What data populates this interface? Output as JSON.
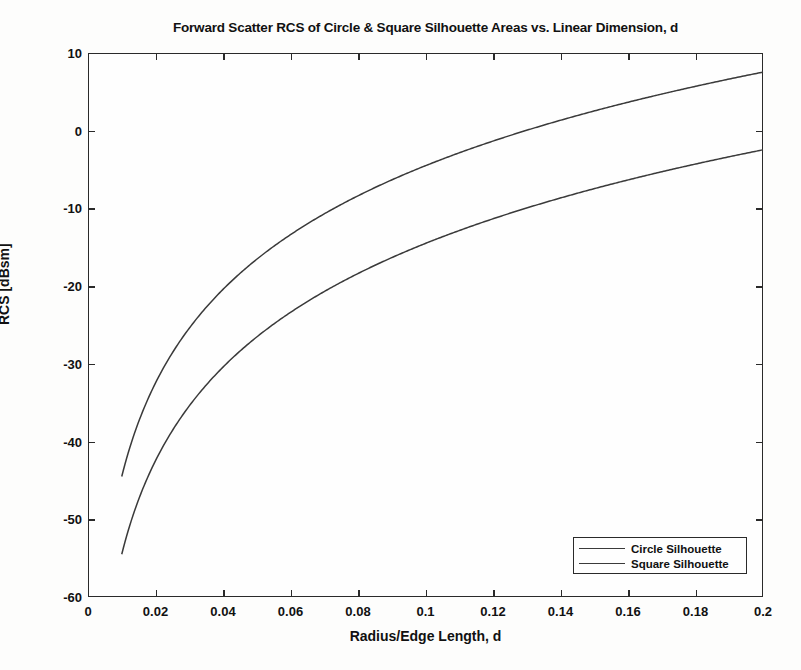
{
  "chart_data": {
    "type": "line",
    "title": "Forward Scatter RCS of Circle & Square Silhouette Areas vs. Linear Dimension, d",
    "xlabel": "Radius/Edge Length, d",
    "ylabel": "RCS [dBsm]",
    "xlim": [
      0,
      0.2
    ],
    "ylim": [
      -60,
      10
    ],
    "xticks": [
      0,
      0.02,
      0.04,
      0.06,
      0.08,
      0.1,
      0.12,
      0.14,
      0.16,
      0.18,
      0.2
    ],
    "xtick_labels": [
      "0",
      "0.02",
      "0.04",
      "0.06",
      "0.08",
      "0.1",
      "0.12",
      "0.14",
      "0.16",
      "0.18",
      "0.2"
    ],
    "yticks": [
      10,
      0,
      -10,
      -20,
      -30,
      -40,
      -50,
      -60
    ],
    "ytick_labels": [
      "10",
      "0",
      "-10",
      "-20",
      "-30",
      "-40",
      "-50",
      "-60"
    ],
    "grid": false,
    "legend_position": "lower right",
    "line_color": "#3a3a3a",
    "x": [
      0.01,
      0.012,
      0.014,
      0.016,
      0.018,
      0.02,
      0.024,
      0.028,
      0.032,
      0.036,
      0.04,
      0.048,
      0.056,
      0.064,
      0.072,
      0.08,
      0.09,
      0.1,
      0.11,
      0.12,
      0.13,
      0.14,
      0.15,
      0.16,
      0.17,
      0.18,
      0.19,
      0.2
    ],
    "series": [
      {
        "name": "Circle Silhouette",
        "values": [
          -44.5,
          -41.3,
          -38.6,
          -36.3,
          -34.3,
          -42.5,
          -27.8,
          -25.1,
          -22.8,
          -20.7,
          -18.9,
          -15.7,
          -13.1,
          -10.8,
          -8.8,
          -7.0,
          -5.0,
          -3.2,
          -1.5,
          0.0,
          1.4,
          2.7,
          3.9,
          5.0,
          6.1,
          7.1,
          8.0,
          7.3
        ]
      },
      {
        "name": "Square Silhouette",
        "values": [
          -54.5,
          -51.3,
          -48.6,
          -46.3,
          -44.3,
          -52.5,
          -37.8,
          -35.1,
          -32.8,
          -30.7,
          -28.9,
          -25.7,
          -23.1,
          -20.8,
          -18.8,
          -17.0,
          -15.0,
          -13.2,
          -11.5,
          -10.0,
          -8.6,
          -7.3,
          -6.1,
          -5.0,
          -3.9,
          -2.9,
          -2.0,
          -3.2
        ]
      }
    ],
    "curve_model": {
      "circle": {
        "formula_note": "40*log10(d) + C_circle",
        "c": 35.5,
        "d_start": 0.01,
        "d_end": 0.2,
        "y_start": -44.5,
        "y_end": 7.3
      },
      "square": {
        "formula_note": "40*log10(d) + C_square",
        "c": 25.5,
        "d_start": 0.01,
        "d_end": 0.2,
        "y_start": -54.5,
        "y_end": -3.2
      }
    }
  },
  "legend": {
    "items": [
      {
        "label": "Circle Silhouette"
      },
      {
        "label": "Square Silhouette"
      }
    ]
  }
}
